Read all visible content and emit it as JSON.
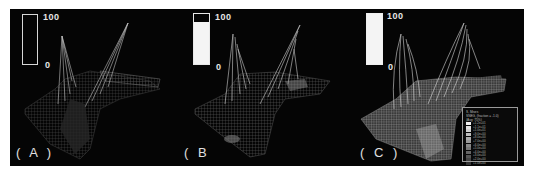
{
  "figure": {
    "background": "#050505",
    "panels": [
      {
        "id": "A",
        "label": "( A )",
        "colorbar": {
          "max_label": "100",
          "min_label": "0",
          "fill_percent": 0
        },
        "description": "wireframe mesh of tower and deck structure, dark render"
      },
      {
        "id": "B",
        "label": "( B",
        "colorbar": {
          "max_label": "100",
          "min_label": "0",
          "fill_percent": 90
        },
        "description": "wireframe mesh with partial stress shading"
      },
      {
        "id": "C",
        "label": "( C )",
        "colorbar": {
          "max_label": "100",
          "min_label": "0",
          "fill_percent": 100
        },
        "description": "wireframe mesh with full stress contour and legend",
        "legend": {
          "header_lines": [
            "S, Mises",
            "SNEG, (fraction = -1.0)",
            "(Avg: 75%)"
          ],
          "swatch_colors": [
            "#f2f2f2",
            "#e0e0e0",
            "#cfcfcf",
            "#bdbdbd",
            "#ababab",
            "#9a9a9a",
            "#888888",
            "#777777",
            "#666666",
            "#555555",
            "#444444",
            "#333333"
          ],
          "values": [
            "+1.2e+01",
            "+1.1e+01",
            "+1.0e+01",
            "+9.0e+00",
            "+8.0e+00",
            "+7.0e+00",
            "+6.0e+00",
            "+5.0e+00",
            "+4.0e+00",
            "+3.0e+00",
            "+2.0e+00",
            "+1.0e+00"
          ]
        }
      }
    ]
  }
}
